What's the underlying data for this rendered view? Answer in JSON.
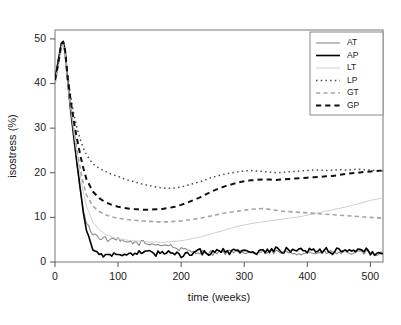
{
  "chart_data": {
    "type": "line",
    "title": "",
    "xlabel": "time (weeks)",
    "ylabel": "isostress (%)",
    "xlim": [
      0,
      520
    ],
    "ylim": [
      0,
      52
    ],
    "xticks": [
      0,
      100,
      200,
      300,
      400,
      500
    ],
    "yticks": [
      0,
      10,
      20,
      30,
      40,
      50
    ],
    "grid": false,
    "legend_position": "top-right",
    "legend_entries": [
      "AT",
      "AP",
      "LT",
      "LP",
      "GT",
      "GP"
    ],
    "x": [
      0,
      5,
      10,
      13,
      16,
      20,
      25,
      30,
      35,
      40,
      45,
      50,
      60,
      70,
      80,
      90,
      100,
      110,
      120,
      130,
      140,
      150,
      160,
      170,
      180,
      190,
      200,
      210,
      220,
      230,
      240,
      250,
      260,
      270,
      280,
      290,
      300,
      310,
      320,
      330,
      340,
      350,
      360,
      370,
      380,
      390,
      400,
      410,
      420,
      430,
      440,
      450,
      460,
      470,
      480,
      490,
      500,
      510,
      520
    ],
    "series": [
      {
        "name": "AT",
        "color": "#8c8c8c",
        "style": "solid",
        "width": 1.1,
        "values": [
          40.5,
          44.0,
          48.6,
          49.2,
          47.0,
          40.0,
          33.0,
          27.0,
          21.5,
          16.0,
          11.5,
          8.6,
          6.4,
          5.5,
          5.2,
          4.8,
          5.0,
          4.3,
          4.6,
          4.1,
          4.4,
          3.9,
          4.2,
          3.7,
          3.9,
          3.2,
          2.8,
          2.5,
          2.4,
          2.2,
          2.3,
          2.0,
          2.2,
          2.1,
          2.3,
          2.0,
          2.2,
          2.1,
          2.0,
          2.2,
          2.1,
          2.3,
          2.0,
          2.2,
          2.1,
          2.0,
          2.2,
          2.1,
          2.0,
          2.2,
          2.1,
          2.0,
          2.2,
          2.1,
          2.0,
          2.1,
          2.0,
          1.9,
          1.8
        ]
      },
      {
        "name": "AP",
        "color": "#000000",
        "style": "solid",
        "width": 1.6,
        "values": [
          41.0,
          45.0,
          49.0,
          49.4,
          47.5,
          41.0,
          34.0,
          28.0,
          22.0,
          16.5,
          11.0,
          7.0,
          3.2,
          1.6,
          1.4,
          1.8,
          1.5,
          2.0,
          1.6,
          2.1,
          1.7,
          2.2,
          1.8,
          2.3,
          1.9,
          2.0,
          1.6,
          2.2,
          1.8,
          2.4,
          1.9,
          2.5,
          2.0,
          2.6,
          2.1,
          2.7,
          2.2,
          2.6,
          2.1,
          2.7,
          2.2,
          2.8,
          2.2,
          2.9,
          2.3,
          2.8,
          2.3,
          3.0,
          2.4,
          2.9,
          2.3,
          3.1,
          2.4,
          2.9,
          2.3,
          2.8,
          2.2,
          2.0,
          1.9
        ]
      },
      {
        "name": "LT",
        "color": "#cfcfcf",
        "style": "solid",
        "width": 1.0,
        "values": [
          40.0,
          43.5,
          48.0,
          48.8,
          46.5,
          40.5,
          34.5,
          29.0,
          24.0,
          19.5,
          15.5,
          12.5,
          9.0,
          7.2,
          6.2,
          5.6,
          5.2,
          5.0,
          4.8,
          4.7,
          4.6,
          4.5,
          4.5,
          4.4,
          4.5,
          4.6,
          4.8,
          5.0,
          5.3,
          5.6,
          6.0,
          6.4,
          6.8,
          7.2,
          7.6,
          8.0,
          8.3,
          8.6,
          8.8,
          9.0,
          9.2,
          9.4,
          9.6,
          9.8,
          10.0,
          10.2,
          10.5,
          10.8,
          11.1,
          11.4,
          11.7,
          12.0,
          12.3,
          12.7,
          13.0,
          13.4,
          13.8,
          14.1,
          14.3
        ]
      },
      {
        "name": "LP",
        "color": "#4d4d4d",
        "style": "dotted",
        "width": 1.5,
        "values": [
          40.2,
          44.2,
          48.8,
          49.3,
          47.2,
          42.0,
          37.0,
          33.0,
          30.0,
          27.5,
          25.5,
          24.0,
          22.0,
          21.0,
          20.3,
          19.6,
          19.2,
          18.6,
          18.2,
          17.8,
          17.4,
          17.1,
          16.8,
          16.6,
          16.5,
          16.6,
          16.8,
          17.2,
          17.6,
          18.0,
          18.5,
          19.0,
          19.4,
          19.7,
          20.0,
          20.2,
          20.4,
          20.5,
          20.4,
          20.3,
          20.2,
          20.0,
          20.1,
          20.2,
          20.3,
          20.4,
          20.5,
          20.6,
          20.6,
          20.5,
          20.6,
          20.7,
          20.6,
          20.7,
          20.8,
          20.7,
          20.6,
          20.5,
          20.4
        ]
      },
      {
        "name": "GT",
        "color": "#a6a6a6",
        "style": "dashed",
        "width": 1.6,
        "values": [
          40.0,
          43.8,
          48.2,
          48.9,
          46.8,
          40.8,
          34.8,
          29.5,
          25.0,
          21.0,
          17.5,
          15.0,
          12.5,
          11.3,
          10.6,
          10.1,
          9.8,
          9.6,
          9.4,
          9.3,
          9.2,
          9.1,
          9.0,
          9.0,
          9.0,
          9.1,
          9.2,
          9.4,
          9.6,
          9.8,
          10.1,
          10.4,
          10.7,
          11.0,
          11.2,
          11.4,
          11.6,
          11.8,
          11.9,
          12.0,
          11.8,
          11.6,
          11.4,
          11.3,
          11.2,
          11.1,
          11.0,
          10.9,
          10.8,
          10.7,
          10.6,
          10.5,
          10.4,
          10.3,
          10.2,
          10.1,
          10.0,
          9.9,
          9.8
        ]
      },
      {
        "name": "GP",
        "color": "#111111",
        "style": "dashed",
        "width": 2.0,
        "values": [
          40.8,
          44.6,
          48.9,
          49.4,
          47.4,
          41.5,
          36.0,
          31.5,
          27.5,
          24.0,
          21.0,
          18.5,
          15.8,
          14.3,
          13.4,
          12.8,
          12.4,
          12.1,
          11.9,
          11.8,
          11.7,
          11.7,
          11.8,
          11.9,
          12.1,
          12.4,
          12.8,
          13.3,
          13.9,
          14.5,
          15.2,
          15.9,
          16.5,
          17.0,
          17.4,
          17.8,
          18.1,
          18.3,
          18.4,
          18.5,
          18.5,
          18.4,
          18.5,
          18.6,
          18.7,
          18.8,
          18.9,
          19.0,
          19.1,
          19.2,
          19.3,
          19.5,
          19.7,
          19.9,
          20.0,
          20.2,
          20.3,
          20.4,
          20.5
        ]
      }
    ]
  }
}
